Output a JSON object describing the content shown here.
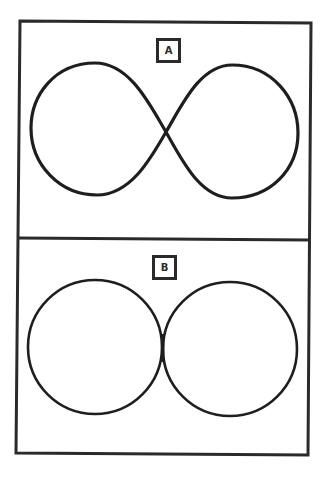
{
  "colors": {
    "stroke": "#1e1e1e",
    "frame": "#2a2a2a",
    "background": "#ffffff"
  },
  "panels": [
    {
      "id": "A",
      "label": "A",
      "shape": "figure-eight (lemniscate) curve with crossing at center",
      "crossing_point": [
        166,
        132
      ]
    },
    {
      "id": "B",
      "label": "B",
      "shape": "two tangent circles touching along a short vertical segment",
      "circles": [
        {
          "cx": 95,
          "cy": 347,
          "r": 67
        },
        {
          "cx": 230,
          "cy": 349,
          "r": 67
        }
      ]
    }
  ]
}
